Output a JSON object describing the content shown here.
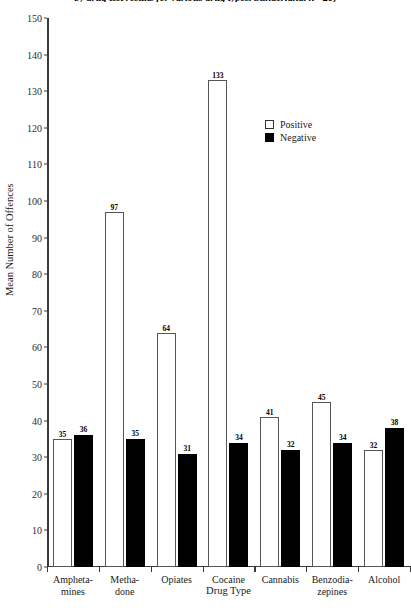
{
  "chart_data": {
    "type": "bar",
    "title": "by drug test results for various drug types. Sunderland. n= 20)",
    "xlabel": "Drug Type",
    "ylabel": "Mean Number of Offences",
    "ylim": [
      0,
      150
    ],
    "ytick_step": 10,
    "grid": false,
    "legend_position": "inside-upper-right",
    "categories": [
      "Amphetamines",
      "Methadone",
      "Opiates",
      "Cocaine",
      "Cannabis",
      "Benzodiazepines",
      "Alcohol"
    ],
    "category_lines": [
      [
        "Ampheta-",
        "mines"
      ],
      [
        "Metha-",
        "done"
      ],
      [
        "Opiates"
      ],
      [
        "Cocaine"
      ],
      [
        "Cannabis"
      ],
      [
        "Benzodia-",
        "zepines"
      ],
      [
        "Alcohol"
      ]
    ],
    "ytick_labels": [
      "0",
      "10",
      "20",
      "30",
      "40",
      "50",
      "60",
      "70",
      "80",
      "90",
      "100",
      "110",
      "120",
      "130",
      "140",
      "150"
    ],
    "series": [
      {
        "name": "Positive",
        "color": "#ffffff",
        "edge_color": "#555555",
        "values": [
          35,
          97,
          64,
          133,
          41,
          45,
          32
        ]
      },
      {
        "name": "Negative",
        "color": "#000000",
        "edge_color": "#000000",
        "values": [
          36,
          35,
          31,
          34,
          32,
          34,
          38
        ]
      }
    ]
  },
  "legend": {
    "items": [
      {
        "label": "Positive",
        "swatch": "open-square"
      },
      {
        "label": "Negative",
        "swatch": "filled-square"
      }
    ]
  }
}
